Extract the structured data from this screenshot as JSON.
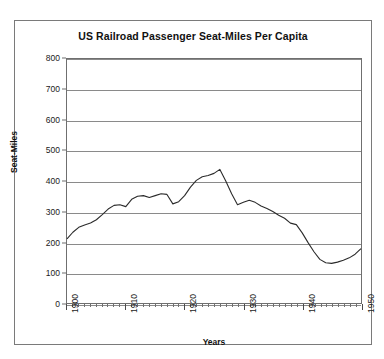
{
  "chart_data": {
    "type": "line",
    "title": "US Railroad Passenger Seat-Miles Per Capita",
    "xlabel": "Years",
    "ylabel": "Seat-Miles",
    "xlim": [
      1900,
      1950
    ],
    "ylim": [
      0,
      800
    ],
    "ytick_labels": [
      "800",
      "700",
      "600",
      "500",
      "400",
      "300",
      "200",
      "100",
      "0"
    ],
    "ytick_values": [
      800,
      700,
      600,
      500,
      400,
      300,
      200,
      100,
      0
    ],
    "xtick_labels": [
      "1900",
      "1910",
      "1920",
      "1930",
      "1940",
      "1950"
    ],
    "xtick_values": [
      1900,
      1910,
      1920,
      1930,
      1940,
      1950
    ],
    "grid": "horizontal",
    "legend": null,
    "line_color": "#2b2b2b",
    "series": [
      {
        "name": "Seat-Miles Per Capita",
        "x": [
          1900,
          1901,
          1902,
          1903,
          1904,
          1905,
          1906,
          1907,
          1908,
          1909,
          1910,
          1911,
          1912,
          1913,
          1914,
          1915,
          1916,
          1917,
          1918,
          1919,
          1920,
          1921,
          1922,
          1923,
          1924,
          1925,
          1926,
          1927,
          1928,
          1929,
          1930,
          1931,
          1932,
          1933,
          1934,
          1935,
          1936,
          1937,
          1938,
          1939,
          1940,
          1941,
          1942,
          1943,
          1944,
          1945,
          1946,
          1947,
          1948,
          1949,
          1950
        ],
        "values": [
          210,
          232,
          248,
          255,
          262,
          272,
          288,
          305,
          318,
          322,
          318,
          338,
          350,
          352,
          347,
          352,
          358,
          355,
          324,
          330,
          352,
          378,
          400,
          412,
          416,
          424,
          438,
          400,
          360,
          322,
          330,
          337,
          330,
          318,
          310,
          300,
          288,
          278,
          262,
          257,
          230,
          198,
          168,
          143,
          132,
          130,
          134,
          140,
          148,
          160,
          178
        ]
      }
    ],
    "note": "values continue: 1935..1950 trough-to-WWII-peak-to-postwar-decline"
  },
  "series_full": {
    "x": [
      1900,
      1901,
      1902,
      1903,
      1904,
      1905,
      1906,
      1907,
      1908,
      1909,
      1910,
      1911,
      1912,
      1913,
      1914,
      1915,
      1916,
      1917,
      1918,
      1919,
      1920,
      1921,
      1922,
      1923,
      1924,
      1925,
      1926,
      1927,
      1928,
      1929,
      1930,
      1931,
      1932,
      1933,
      1934,
      1935,
      1936,
      1937,
      1938,
      1939,
      1940,
      1941,
      1942,
      1943,
      1944,
      1945,
      1946,
      1947,
      1948,
      1949,
      1950
    ],
    "values": [
      210,
      232,
      248,
      256,
      262,
      273,
      290,
      308,
      320,
      322,
      316,
      340,
      350,
      352,
      346,
      352,
      358,
      356,
      325,
      332,
      352,
      380,
      402,
      414,
      418,
      425,
      438,
      400,
      358,
      322,
      330,
      337,
      330,
      318,
      310,
      300,
      288,
      278,
      262,
      257,
      230,
      198,
      168,
      143,
      132,
      130,
      134,
      140,
      148,
      160,
      178
    ]
  },
  "page": {
    "background": "#ffffff",
    "frame_color": "#7a7a7a"
  }
}
